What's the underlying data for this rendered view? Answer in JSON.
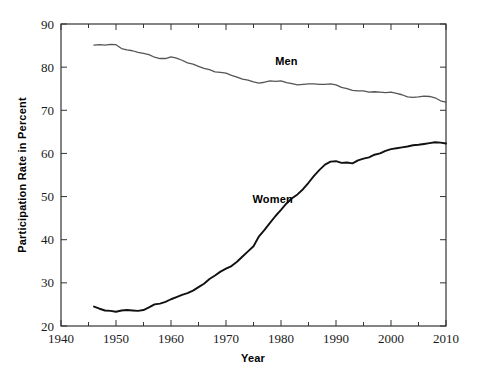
{
  "chart_data": {
    "type": "line",
    "title": "",
    "xlabel": "Year",
    "ylabel": "Participation Rate in Percent",
    "xlim": [
      1940,
      2010
    ],
    "ylim": [
      20,
      90
    ],
    "xticks": [
      1940,
      1950,
      1960,
      1970,
      1980,
      1990,
      2000,
      2010
    ],
    "xtick_labels": [
      "1940",
      "1950",
      "1960",
      "1970",
      "1980",
      "1990",
      "2000",
      "2010"
    ],
    "xminor_step": 5,
    "yticks": [
      20,
      30,
      40,
      50,
      60,
      70,
      80,
      90
    ],
    "ytick_labels": [
      "20",
      "30",
      "40",
      "50",
      "60",
      "70",
      "80",
      "90"
    ],
    "grid": false,
    "legend_position": "inline-annotation",
    "series": [
      {
        "name": "Men",
        "color": "#555555",
        "label_x": 1981,
        "label_y": 80.5,
        "x": [
          1946,
          1947,
          1948,
          1949,
          1950,
          1951,
          1952,
          1953,
          1954,
          1955,
          1956,
          1957,
          1958,
          1959,
          1960,
          1961,
          1962,
          1963,
          1964,
          1965,
          1966,
          1967,
          1968,
          1969,
          1970,
          1971,
          1972,
          1973,
          1974,
          1975,
          1976,
          1977,
          1978,
          1979,
          1980,
          1981,
          1982,
          1983,
          1984,
          1985,
          1986,
          1987,
          1988,
          1989,
          1990,
          1991,
          1992,
          1993,
          1994,
          1995,
          1996,
          1997,
          1998,
          1999,
          2000,
          2001,
          2002,
          2003,
          2004,
          2005,
          2006,
          2007,
          2008,
          2009,
          2010
        ],
        "values": [
          85.1,
          85.2,
          85.1,
          85.3,
          85.2,
          84.3,
          84.0,
          83.8,
          83.4,
          83.2,
          82.9,
          82.3,
          82.0,
          82.0,
          82.4,
          82.1,
          81.6,
          81.0,
          80.7,
          80.2,
          79.7,
          79.4,
          78.9,
          78.8,
          78.6,
          78.1,
          77.7,
          77.2,
          77.0,
          76.6,
          76.3,
          76.5,
          76.8,
          76.7,
          76.8,
          76.4,
          76.2,
          75.9,
          76.0,
          76.1,
          76.1,
          76.0,
          76.0,
          76.1,
          75.9,
          75.3,
          75.0,
          74.6,
          74.5,
          74.5,
          74.2,
          74.3,
          74.2,
          74.1,
          74.2,
          73.9,
          73.6,
          73.1,
          73.0,
          73.1,
          73.3,
          73.2,
          72.9,
          72.2,
          71.9
        ]
      },
      {
        "name": "Women",
        "color": "#111111",
        "label_x": 1978.5,
        "label_y": 48.5,
        "x": [
          1946,
          1947,
          1948,
          1949,
          1950,
          1951,
          1952,
          1953,
          1954,
          1955,
          1956,
          1957,
          1958,
          1959,
          1960,
          1961,
          1962,
          1963,
          1964,
          1965,
          1966,
          1967,
          1968,
          1969,
          1970,
          1971,
          1972,
          1973,
          1974,
          1975,
          1976,
          1977,
          1978,
          1979,
          1980,
          1981,
          1982,
          1983,
          1984,
          1985,
          1986,
          1987,
          1988,
          1989,
          1990,
          1991,
          1992,
          1993,
          1994,
          1995,
          1996,
          1997,
          1998,
          1999,
          2000,
          2001,
          2002,
          2003,
          2004,
          2005,
          2006,
          2007,
          2008,
          2009,
          2010
        ],
        "values": [
          24.5,
          24.0,
          23.6,
          23.5,
          23.3,
          23.6,
          23.7,
          23.6,
          23.5,
          23.7,
          24.3,
          25.0,
          25.2,
          25.6,
          26.2,
          26.7,
          27.2,
          27.6,
          28.2,
          29.0,
          29.8,
          30.9,
          31.7,
          32.6,
          33.3,
          33.9,
          34.9,
          36.1,
          37.3,
          38.5,
          40.8,
          42.3,
          43.9,
          45.5,
          46.9,
          48.4,
          49.6,
          50.5,
          51.7,
          53.2,
          54.8,
          56.2,
          57.4,
          58.1,
          58.2,
          57.8,
          57.9,
          57.7,
          58.4,
          58.8,
          59.1,
          59.7,
          60.0,
          60.6,
          61.0,
          61.2,
          61.4,
          61.6,
          61.9,
          62.0,
          62.2,
          62.4,
          62.6,
          62.5,
          62.3
        ]
      }
    ]
  },
  "figure": {
    "ylabel_text": "Participation Rate in Percent",
    "xlabel_text": "Year"
  }
}
